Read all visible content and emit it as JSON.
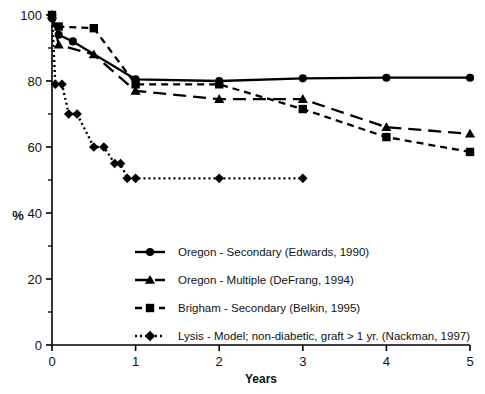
{
  "chart_data": {
    "type": "line",
    "title": "",
    "xlabel": "Years",
    "ylabel": "%",
    "xlim": [
      0,
      5
    ],
    "ylim": [
      0,
      100
    ],
    "grid": false,
    "legend_position": "inside-lower-center",
    "x_ticks": [
      "0",
      "1",
      "2",
      "3",
      "4",
      "5"
    ],
    "x_tick_values": [
      0,
      1,
      2,
      3,
      4,
      5
    ],
    "y_ticks": [
      "0",
      "20",
      "40",
      "60",
      "80",
      "100"
    ],
    "y_tick_values": [
      0,
      20,
      40,
      60,
      80,
      100
    ],
    "y_minor_ticks": [
      10,
      30,
      50,
      70,
      90
    ],
    "series": [
      {
        "name": "Oregon - Secondary (Edwards, 1990)",
        "marker": "circle",
        "line_style": "solid",
        "x": [
          0,
          0.08,
          0.25,
          1,
          2,
          3,
          4,
          5
        ],
        "values": [
          99,
          94,
          92,
          80.5,
          80,
          80.8,
          81,
          81
        ]
      },
      {
        "name": "Oregon - Multiple (DeFrang, 1994)",
        "marker": "triangle",
        "line_style": "long-dash",
        "x": [
          0,
          0.08,
          0.5,
          1,
          2,
          3,
          4,
          5
        ],
        "values": [
          100,
          91,
          88,
          77,
          74.5,
          74.5,
          66,
          64
        ]
      },
      {
        "name": "Brigham - Secondary (Belkin, 1995)",
        "marker": "square",
        "line_style": "dash",
        "x": [
          0,
          0.08,
          0.5,
          1,
          2,
          3,
          4,
          5
        ],
        "values": [
          100,
          96.5,
          96,
          79,
          79,
          71.5,
          63,
          58.5
        ]
      },
      {
        "name": "Lysis - Model; non-diabetic, graft > 1 yr. (Nackman, 1997)",
        "marker": "diamond",
        "line_style": "dotted",
        "x": [
          0,
          0.04,
          0.12,
          0.2,
          0.3,
          0.5,
          0.62,
          0.75,
          0.82,
          0.9,
          1,
          2,
          3
        ],
        "values": [
          100,
          79,
          79,
          70,
          70,
          60,
          60,
          55,
          55,
          50.5,
          50.5,
          50.5,
          50.5
        ]
      }
    ]
  },
  "legend": {
    "entries": [
      {
        "label": "Oregon - Secondary (Edwards, 1990)",
        "marker": "circle",
        "line_style": "solid"
      },
      {
        "label": "Oregon - Multiple (DeFrang, 1994)",
        "marker": "triangle",
        "line_style": "long-dash"
      },
      {
        "label": "Brigham - Secondary (Belkin, 1995)",
        "marker": "square",
        "line_style": "dash"
      },
      {
        "label": "Lysis - Model; non-diabetic, graft > 1 yr. (Nackman, 1997)",
        "marker": "diamond",
        "line_style": "dotted"
      }
    ]
  },
  "colors": {
    "ink": "#000000",
    "background": "#ffffff"
  }
}
